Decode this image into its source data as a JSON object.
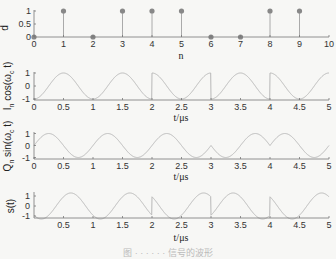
{
  "figure": {
    "caption": "图 · · · · · · 信号的波形"
  },
  "chart_data": [
    {
      "type": "stem",
      "title": "",
      "xlabel": "n",
      "ylabel": "d",
      "x": [
        0,
        1,
        2,
        3,
        4,
        5,
        6,
        7,
        8,
        9
      ],
      "values": [
        0,
        1,
        0,
        1,
        1,
        1,
        0,
        0,
        1,
        1
      ],
      "xlim": [
        0,
        10
      ],
      "ylim": [
        0,
        1
      ],
      "xticks": [
        "0",
        "1",
        "2",
        "3",
        "4",
        "5",
        "6",
        "7",
        "8",
        "9",
        "10"
      ],
      "yticks": [
        "0",
        "0.5",
        "1"
      ],
      "grid": false
    },
    {
      "type": "line",
      "title": "",
      "xlabel": "t/μs",
      "ylabel": "I_n cos(ω_c t)",
      "description": "Cosine carrier of period 1 μs multiplied by I_n; phase flips at t=2, 3, 4 μs",
      "segments": [
        {
          "t_start": 0,
          "t_end": 2,
          "sign": -1
        },
        {
          "t_start": 2,
          "t_end": 3,
          "sign": 1
        },
        {
          "t_start": 3,
          "t_end": 4,
          "sign": -1
        },
        {
          "t_start": 4,
          "t_end": 5,
          "sign": 1
        }
      ],
      "carrier_freq_mhz": 1,
      "xlim": [
        0,
        5
      ],
      "ylim": [
        -1,
        1
      ],
      "xticks": [
        "0",
        "0.5",
        "1",
        "1.5",
        "2",
        "2.5",
        "3",
        "3.5",
        "4",
        "4.5",
        "5"
      ],
      "yticks": [
        "-1",
        "0",
        "1"
      ]
    },
    {
      "type": "line",
      "title": "",
      "xlabel": "t/μs",
      "ylabel": "Q_n sin(ω_c t)",
      "description": "Sine carrier of period 1 μs multiplied by Q_n; sign changes near t=3 and t=4 μs",
      "segments": [
        {
          "t_start": 0,
          "t_end": 3,
          "sign": 1
        },
        {
          "t_start": 3,
          "t_end": 4,
          "sign": -1
        },
        {
          "t_start": 4,
          "t_end": 5,
          "sign": 1
        }
      ],
      "carrier_freq_mhz": 1,
      "xlim": [
        0,
        5
      ],
      "ylim": [
        -1,
        1
      ],
      "xticks": [
        "0",
        "0.5",
        "1",
        "1.5",
        "2",
        "2.5",
        "3",
        "3.5",
        "4",
        "4.5",
        "5"
      ],
      "yticks": [
        "-1",
        "0",
        "1"
      ]
    },
    {
      "type": "line",
      "title": "",
      "xlabel": "t/μs",
      "ylabel": "s(t)",
      "description": "QPSK signal s(t) = I_n cos(ω_c t) − Q_n sin(ω_c t), amplitude √2, phase jumps at 2, 3, 4 μs",
      "amplitude": 1.414,
      "xlim": [
        0,
        5
      ],
      "ylim": [
        -1,
        1.5
      ],
      "xticks": [
        "0.5",
        "1",
        "1.5",
        "2",
        "2.5",
        "3",
        "3.5",
        "4",
        "4.5",
        "5"
      ],
      "yticks": [
        "-1",
        "0",
        "1"
      ]
    }
  ]
}
